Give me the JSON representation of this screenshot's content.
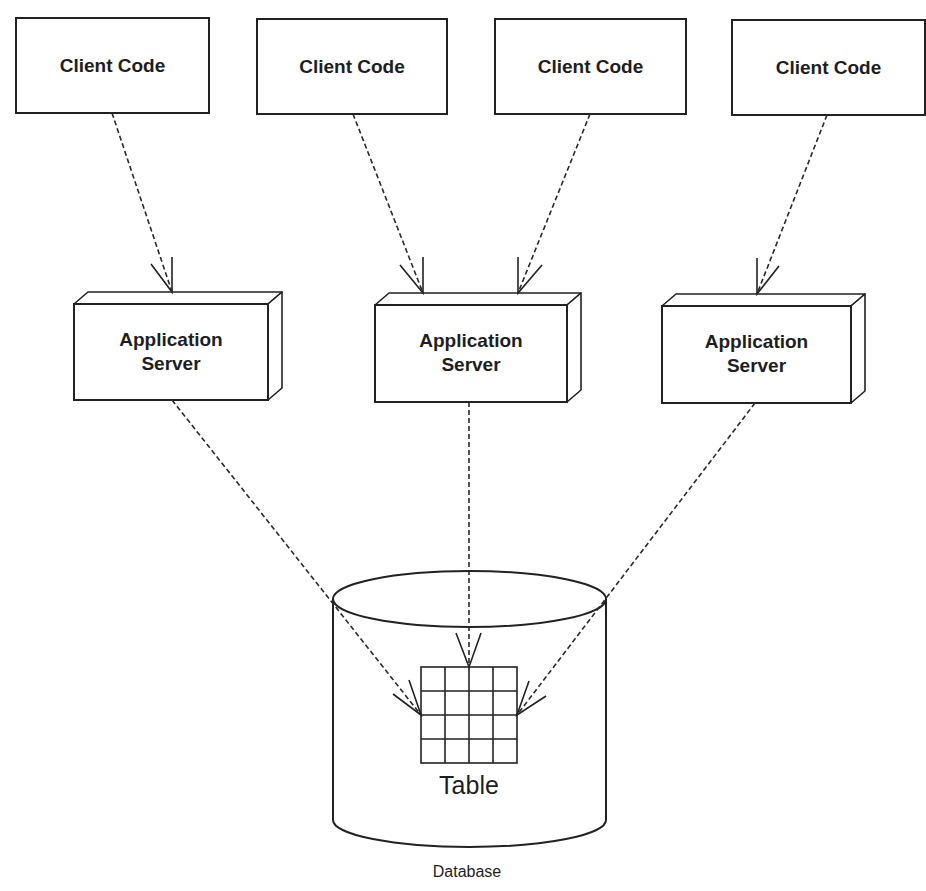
{
  "diagram": {
    "type": "deployment",
    "clients": [
      {
        "id": "client-1",
        "label": "Client Code",
        "x": 16,
        "y": 18,
        "w": 193,
        "h": 95
      },
      {
        "id": "client-2",
        "label": "Client Code",
        "x": 257,
        "y": 19,
        "w": 190,
        "h": 95
      },
      {
        "id": "client-3",
        "label": "Client Code",
        "x": 495,
        "y": 19,
        "w": 191,
        "h": 95
      },
      {
        "id": "client-4",
        "label": "Client Code",
        "x": 732,
        "y": 20,
        "w": 193,
        "h": 95
      }
    ],
    "servers": [
      {
        "id": "server-1",
        "line1": "Application",
        "line2": "Server",
        "x": 74,
        "y": 304,
        "w": 194,
        "h": 96,
        "depth_x": 14,
        "depth_y": 12
      },
      {
        "id": "server-2",
        "line1": "Application",
        "line2": "Server",
        "x": 375,
        "y": 305,
        "w": 192,
        "h": 97,
        "depth_x": 14,
        "depth_y": 12
      },
      {
        "id": "server-3",
        "line1": "Application",
        "line2": "Server",
        "x": 662,
        "y": 306,
        "w": 189,
        "h": 97,
        "depth_x": 14,
        "depth_y": 12
      }
    ],
    "database": {
      "label": "Database",
      "table_label": "Table",
      "cylinder": {
        "left": 333,
        "right": 606,
        "top_cy": 599,
        "bottom_cy": 820,
        "ry": 28
      },
      "table_grid": {
        "x": 421,
        "y": 667,
        "size": 96,
        "rows": 4,
        "cols": 4
      }
    },
    "connections": [
      {
        "from": "client-1",
        "to": "server-1",
        "x1": 112,
        "y1": 113,
        "x2": 172,
        "y2": 292,
        "style": "dashed",
        "arrow": "open"
      },
      {
        "from": "client-2",
        "to": "server-2",
        "x1": 353,
        "y1": 114,
        "x2": 423,
        "y2": 293,
        "style": "dashed",
        "arrow": "open"
      },
      {
        "from": "client-3",
        "to": "server-2",
        "x1": 590,
        "y1": 114,
        "x2": 518,
        "y2": 293,
        "style": "dashed",
        "arrow": "open"
      },
      {
        "from": "client-4",
        "to": "server-3",
        "x1": 827,
        "y1": 115,
        "x2": 757,
        "y2": 294,
        "style": "dashed",
        "arrow": "open"
      },
      {
        "from": "server-1",
        "to": "table",
        "x1": 172,
        "y1": 400,
        "x2": 421,
        "y2": 715,
        "style": "dashed",
        "arrow": "open"
      },
      {
        "from": "server-2",
        "to": "table",
        "x1": 469,
        "y1": 402,
        "x2": 469,
        "y2": 667,
        "style": "dashed",
        "arrow": "open"
      },
      {
        "from": "server-3",
        "to": "table",
        "x1": 755,
        "y1": 403,
        "x2": 517,
        "y2": 715,
        "style": "dashed",
        "arrow": "open"
      }
    ],
    "colors": {
      "background": "#ffffff",
      "stroke": "#222222",
      "text": "#1e1e1e"
    }
  }
}
